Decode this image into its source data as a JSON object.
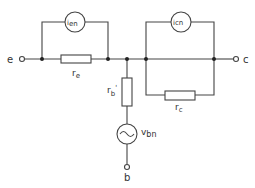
{
  "diagram": {
    "type": "transistor noise equivalent circuit",
    "terminals": {
      "emitter": "e",
      "collector": "c",
      "base": "b"
    },
    "components": {
      "emitter_noise_current": {
        "main": "i",
        "sub": "en"
      },
      "collector_noise_current": {
        "main": "i",
        "sub": "cn"
      },
      "emitter_resistance": {
        "main": "r",
        "sub": "e"
      },
      "collector_resistance": {
        "main": "r",
        "sub": "c"
      },
      "base_resistance": {
        "main": "r",
        "sub": "b",
        "prime": "'"
      },
      "base_noise_voltage": {
        "main": "v",
        "sub": "bn"
      }
    }
  }
}
